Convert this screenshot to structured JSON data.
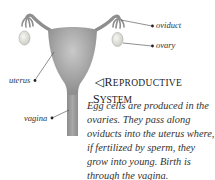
{
  "diagram": {
    "title_arrow": "◁",
    "title_line1_initial": "R",
    "title_line1_rest": "EPRODUCTIVE",
    "title_line2_initial": "S",
    "title_line2_rest": "YSTEM",
    "labels": {
      "oviduct": "oviduct",
      "ovary": "ovary",
      "uterus": "uterus",
      "vagina": "vagina"
    },
    "caption_lines": [
      "Egg cells are produced in the",
      "ovaries. They pass along",
      "oviducts into the uterus where,",
      "if fertilized by sperm, they",
      "grow into young. Birth is",
      "through the vagina."
    ],
    "colors": {
      "organ_fill": "#9a9a9a",
      "organ_highlight": "#c8c8c8",
      "ovary_fill": "#e8e8e0",
      "leader_line": "#444444"
    }
  }
}
